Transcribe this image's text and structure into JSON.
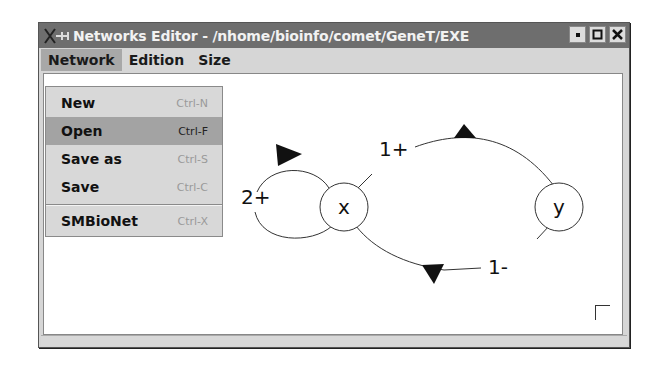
{
  "window": {
    "title": "Networks Editor - /nhome/bioinfo/comet/GeneT/EXE",
    "buttons": [
      "minimize",
      "maximize",
      "close"
    ]
  },
  "menubar": {
    "items": [
      {
        "label": "Network",
        "active": true
      },
      {
        "label": "Edition",
        "active": false
      },
      {
        "label": "Size",
        "active": false
      }
    ]
  },
  "network_menu": {
    "items": [
      {
        "label": "New",
        "shortcut": "Ctrl-N",
        "selected": false
      },
      {
        "label": "Open",
        "shortcut": "Ctrl-F",
        "selected": true
      },
      {
        "label": "Save as",
        "shortcut": "Ctrl-S",
        "selected": false
      },
      {
        "label": "Save",
        "shortcut": "Ctrl-C",
        "selected": false
      },
      {
        "label": "SMBioNet",
        "shortcut": "Ctrl-X",
        "selected": false
      }
    ]
  },
  "graph": {
    "nodes": [
      {
        "id": "x",
        "label": "x"
      },
      {
        "id": "y",
        "label": "y"
      }
    ],
    "edges": [
      {
        "from": "x",
        "to": "x",
        "label": "2+"
      },
      {
        "from": "x",
        "to": "y",
        "label": "1+"
      },
      {
        "from": "y",
        "to": "x",
        "label": "1-"
      }
    ]
  }
}
